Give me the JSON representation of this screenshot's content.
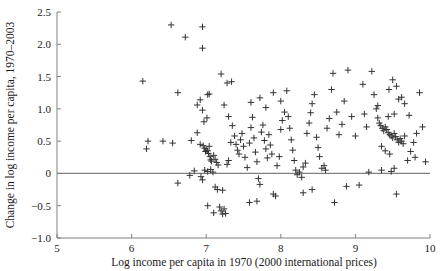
{
  "chart_data": {
    "type": "scatter",
    "title": "",
    "xlabel": "Log income per capita in 1970 (2000 international prices)",
    "ylabel": "Change in log income per capita, 1970–2003",
    "xlim": [
      5,
      10
    ],
    "ylim": [
      -1.0,
      2.5
    ],
    "xticks": [
      5,
      6,
      7,
      8,
      9,
      10
    ],
    "xticklabels": [
      "5",
      "6",
      "7",
      "8",
      "9",
      "10"
    ],
    "yticks": [
      -1.0,
      -0.5,
      0,
      0.5,
      1.0,
      1.5,
      2.0,
      2.5
    ],
    "yticklabels": [
      "−1.0",
      "−0.5",
      "0",
      "0.5",
      "1.0",
      "1.5",
      "2.0",
      "2.5"
    ],
    "grid": false,
    "legend": null,
    "marker": "plus",
    "marker_color": "#333333",
    "reference_lines": [
      {
        "orientation": "horizontal",
        "value": 0,
        "color": "#808080"
      }
    ],
    "points": [
      [
        6.15,
        1.43
      ],
      [
        6.53,
        2.3
      ],
      [
        6.72,
        2.11
      ],
      [
        6.95,
        2.27
      ],
      [
        6.95,
        1.94
      ],
      [
        6.62,
        1.25
      ],
      [
        6.88,
        1.06
      ],
      [
        6.92,
        1.14
      ],
      [
        6.95,
        0.98
      ],
      [
        7.02,
        1.22
      ],
      [
        7.04,
        1.23
      ],
      [
        6.97,
        0.8
      ],
      [
        7.01,
        0.86
      ],
      [
        6.22,
        0.5
      ],
      [
        6.2,
        0.38
      ],
      [
        6.42,
        0.5
      ],
      [
        6.55,
        0.47
      ],
      [
        6.8,
        0.51
      ],
      [
        6.88,
        0.63
      ],
      [
        6.92,
        0.45
      ],
      [
        6.96,
        0.43
      ],
      [
        6.98,
        0.39
      ],
      [
        6.99,
        0.34
      ],
      [
        7.0,
        0.36
      ],
      [
        7.02,
        0.35
      ],
      [
        7.03,
        0.31
      ],
      [
        7.04,
        0.42
      ],
      [
        7.05,
        0.26
      ],
      [
        7.06,
        0.21
      ],
      [
        7.07,
        0.19
      ],
      [
        7.1,
        0.28
      ],
      [
        7.12,
        0.22
      ],
      [
        7.14,
        0.17
      ],
      [
        7.16,
        0.13
      ],
      [
        6.84,
        0.04
      ],
      [
        6.78,
        -0.03
      ],
      [
        6.62,
        -0.15
      ],
      [
        6.93,
        -0.05
      ],
      [
        6.98,
        0.05
      ],
      [
        7.02,
        0.03
      ],
      [
        7.06,
        0.06
      ],
      [
        7.09,
        0.02
      ],
      [
        6.95,
        -0.1
      ],
      [
        7.12,
        -0.21
      ],
      [
        7.15,
        -0.25
      ],
      [
        7.22,
        -0.26
      ],
      [
        7.02,
        -0.5
      ],
      [
        7.1,
        -0.61
      ],
      [
        7.18,
        -0.52
      ],
      [
        7.2,
        -0.58
      ],
      [
        7.22,
        -0.63
      ],
      [
        7.24,
        -0.55
      ],
      [
        7.26,
        -0.62
      ],
      [
        7.28,
        0.14
      ],
      [
        7.3,
        0.2
      ],
      [
        7.33,
        0.48
      ],
      [
        7.35,
        0.74
      ],
      [
        7.3,
        0.88
      ],
      [
        7.24,
        1.06
      ],
      [
        7.28,
        1.4
      ],
      [
        7.34,
        1.42
      ],
      [
        7.2,
        1.54
      ],
      [
        7.38,
        0.58
      ],
      [
        7.4,
        0.45
      ],
      [
        7.42,
        0.36
      ],
      [
        7.44,
        0.3
      ],
      [
        7.46,
        0.52
      ],
      [
        7.48,
        0.62
      ],
      [
        7.5,
        0.42
      ],
      [
        7.52,
        0.25
      ],
      [
        7.55,
        0.09
      ],
      [
        7.58,
        0.47
      ],
      [
        7.6,
        0.71
      ],
      [
        7.62,
        0.87
      ],
      [
        7.64,
        0.55
      ],
      [
        7.66,
        0.33
      ],
      [
        7.68,
        0.18
      ],
      [
        7.7,
        -0.08
      ],
      [
        7.72,
        -0.17
      ],
      [
        7.74,
        0.64
      ],
      [
        7.76,
        0.75
      ],
      [
        7.78,
        0.51
      ],
      [
        7.8,
        0.38
      ],
      [
        7.82,
        0.24
      ],
      [
        7.84,
        0.6
      ],
      [
        7.86,
        0.44
      ],
      [
        7.88,
        0.3
      ],
      [
        7.9,
        -0.32
      ],
      [
        7.93,
        -0.35
      ],
      [
        7.95,
        0.12
      ],
      [
        7.98,
        0.26
      ],
      [
        8.0,
        0.68
      ],
      [
        8.02,
        0.82
      ],
      [
        8.05,
        0.95
      ],
      [
        7.6,
        1.1
      ],
      [
        7.72,
        1.17
      ],
      [
        7.8,
        1.02
      ],
      [
        7.9,
        1.25
      ],
      [
        8.0,
        1.12
      ],
      [
        8.08,
        1.28
      ],
      [
        8.1,
        0.88
      ],
      [
        8.12,
        0.7
      ],
      [
        8.14,
        0.52
      ],
      [
        8.16,
        0.36
      ],
      [
        8.18,
        0.2
      ],
      [
        8.2,
        0.05
      ],
      [
        8.22,
        -0.02
      ],
      [
        8.25,
        0.02
      ],
      [
        8.28,
        -0.06
      ],
      [
        8.3,
        0.1
      ],
      [
        8.33,
        0.16
      ],
      [
        8.35,
        0.62
      ],
      [
        8.38,
        0.78
      ],
      [
        8.4,
        0.94
      ],
      [
        8.42,
        1.08
      ],
      [
        8.45,
        1.22
      ],
      [
        8.48,
        0.56
      ],
      [
        8.5,
        0.4
      ],
      [
        8.52,
        0.26
      ],
      [
        8.55,
        0.08
      ],
      [
        8.58,
        0.12
      ],
      [
        8.6,
        0.05
      ],
      [
        8.62,
        0.7
      ],
      [
        8.65,
        0.85
      ],
      [
        8.68,
        1.3
      ],
      [
        8.7,
        1.55
      ],
      [
        8.72,
        -0.45
      ],
      [
        8.75,
        0.95
      ],
      [
        8.78,
        0.6
      ],
      [
        8.82,
        0.76
      ],
      [
        8.85,
        1.12
      ],
      [
        8.9,
        1.6
      ],
      [
        8.95,
        0.88
      ],
      [
        9.0,
        0.58
      ],
      [
        9.05,
        -0.18
      ],
      [
        9.1,
        1.38
      ],
      [
        9.12,
        0.92
      ],
      [
        9.15,
        0.72
      ],
      [
        9.18,
        0.02
      ],
      [
        9.22,
        1.58
      ],
      [
        9.25,
        1.22
      ],
      [
        9.28,
        1.0
      ],
      [
        9.3,
        0.86
      ],
      [
        9.32,
        0.78
      ],
      [
        9.34,
        0.74
      ],
      [
        9.36,
        0.7
      ],
      [
        9.38,
        0.66
      ],
      [
        9.4,
        0.72
      ],
      [
        9.42,
        0.68
      ],
      [
        9.44,
        0.63
      ],
      [
        9.46,
        0.6
      ],
      [
        9.48,
        0.58
      ],
      [
        9.5,
        0.55
      ],
      [
        9.52,
        0.62
      ],
      [
        9.54,
        0.57
      ],
      [
        9.56,
        0.52
      ],
      [
        9.58,
        0.48
      ],
      [
        9.6,
        0.54
      ],
      [
        9.62,
        0.5
      ],
      [
        9.64,
        0.46
      ],
      [
        9.66,
        0.58
      ],
      [
        9.45,
        1.3
      ],
      [
        9.5,
        1.45
      ],
      [
        9.55,
        1.35
      ],
      [
        9.58,
        1.15
      ],
      [
        9.62,
        1.18
      ],
      [
        9.66,
        1.08
      ],
      [
        9.44,
        0.88
      ],
      [
        9.52,
        0.92
      ],
      [
        9.3,
        1.05
      ],
      [
        9.35,
        0.42
      ],
      [
        9.4,
        0.35
      ],
      [
        9.46,
        0.3
      ],
      [
        9.55,
        -0.32
      ],
      [
        9.35,
        0.05
      ],
      [
        9.48,
        0.03
      ],
      [
        9.52,
        0.08
      ],
      [
        9.7,
        0.2
      ],
      [
        9.74,
        0.34
      ],
      [
        9.78,
        0.48
      ],
      [
        9.82,
        0.62
      ],
      [
        9.86,
        1.25
      ],
      [
        9.9,
        0.72
      ],
      [
        9.94,
        0.18
      ],
      [
        9.72,
        0.9
      ],
      [
        9.8,
        0.25
      ],
      [
        8.88,
        -0.2
      ],
      [
        8.42,
        -0.25
      ],
      [
        8.3,
        -0.3
      ],
      [
        7.58,
        -0.45
      ],
      [
        7.68,
        -0.43
      ]
    ]
  },
  "axes": {
    "x_axis_name": "x-axis",
    "y_axis_name": "y-axis"
  }
}
